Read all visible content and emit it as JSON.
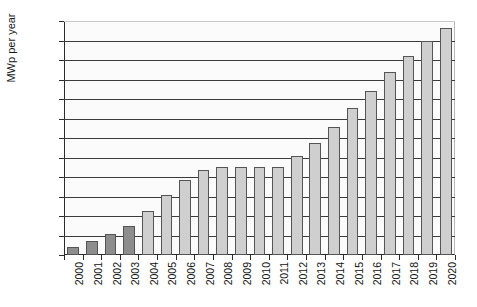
{
  "chart_data": {
    "type": "bar",
    "title": "",
    "xlabel": "",
    "ylabel": "MWp per year",
    "ylim": [
      0,
      6000
    ],
    "ytick_step": 500,
    "yticks": [
      0,
      500,
      1000,
      1500,
      2000,
      2500,
      3000,
      3500,
      4000,
      4500,
      5000,
      5500,
      6000
    ],
    "ytick_labels": [
      "0",
      "500",
      "1000",
      "1500",
      "2000",
      "2500",
      "3000",
      "3500",
      "4000",
      "4500",
      "5000",
      "5500",
      "6000"
    ],
    "grid": true,
    "legend": "none",
    "categories": [
      "2000",
      "2001",
      "2002",
      "2003",
      "2004",
      "2005",
      "2006",
      "2007",
      "2008",
      "2009",
      "2010",
      "2011",
      "2012",
      "2013",
      "2014",
      "2015",
      "2016",
      "2017",
      "2018",
      "2019",
      "2020"
    ],
    "values": [
      200,
      350,
      550,
      750,
      1120,
      1540,
      1920,
      2180,
      2250,
      2250,
      2260,
      2250,
      2550,
      2880,
      3280,
      3760,
      4200,
      4700,
      5100,
      5480,
      5820
    ],
    "bar_styles": [
      "dark",
      "dark",
      "dark",
      "dark",
      "light",
      "light",
      "light",
      "light",
      "light",
      "light",
      "light",
      "light",
      "light",
      "light",
      "light",
      "light",
      "light",
      "light",
      "light",
      "light",
      "light"
    ],
    "colors": {
      "bar_dark": "#8d8d8d",
      "bar_light": "#cfcfcf",
      "bar_edge": "#555555",
      "gridline": "#3b3b3b",
      "axis": "#2b2b2b",
      "text": "#111111",
      "plot_background": "#fbfbfb"
    }
  }
}
